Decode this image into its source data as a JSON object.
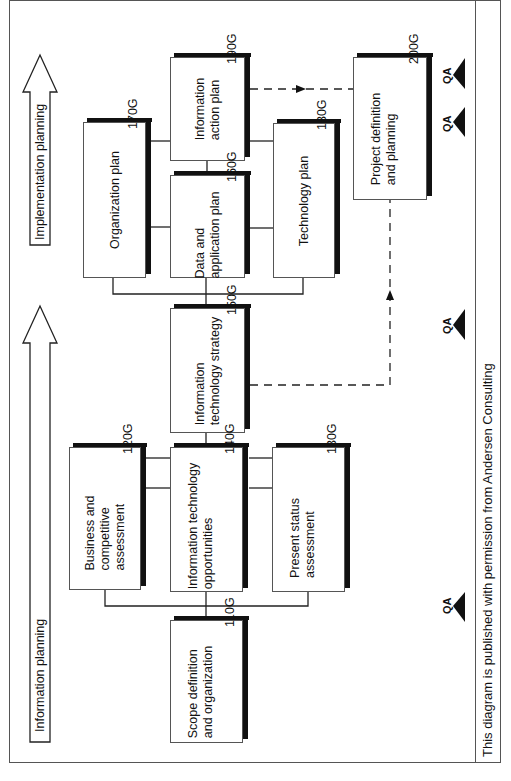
{
  "diagram": {
    "orientation": "rotated-90-ccw",
    "phases": [
      {
        "label": "Information planning"
      },
      {
        "label": "Implementation planning"
      }
    ],
    "boxes": [
      {
        "id": "110G",
        "label_line1": "Scope definition",
        "label_line2": "and organization"
      },
      {
        "id": "120G",
        "label_line1": "Business and",
        "label_line2": "competitive",
        "label_line3": "assessment"
      },
      {
        "id": "130G",
        "label_line1": "Present status",
        "label_line2": "assessment"
      },
      {
        "id": "140G",
        "label_line1": "Information technology",
        "label_line2": "opportunities"
      },
      {
        "id": "150G",
        "label_line1": "Information",
        "label_line2": "technology strategy"
      },
      {
        "id": "160G",
        "label_line1": "Data and",
        "label_line2": "application plan"
      },
      {
        "id": "170G",
        "label_line1": "Organization plan"
      },
      {
        "id": "180G",
        "label_line1": "Technology plan"
      },
      {
        "id": "190G",
        "label_line1": "Information",
        "label_line2": "action plan"
      },
      {
        "id": "200G",
        "label_line1": "Project definition",
        "label_line2": "and planning"
      }
    ],
    "qa_markers": [
      "QA",
      "QA",
      "QA",
      "QA"
    ],
    "caption": "This diagram is published with permission from Andersen Consulting"
  }
}
